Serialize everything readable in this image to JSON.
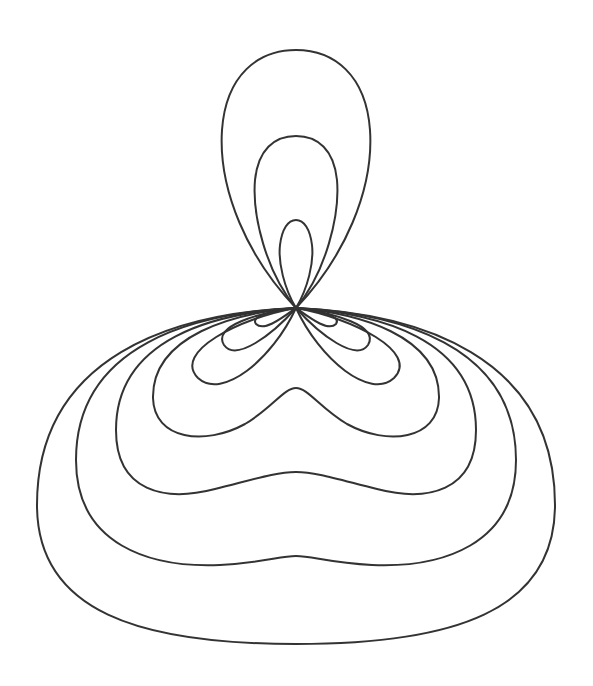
{
  "figure": {
    "background": "#ffffff",
    "stroke_color": "#333333",
    "origin": [
      296,
      308
    ],
    "top_lobes": [
      {
        "name": "top-lobe-outer",
        "top_y": 50,
        "x_range": [
          222,
          370
        ]
      },
      {
        "name": "top-lobe-middle",
        "top_y": 136,
        "x_range": [
          254,
          338
        ]
      },
      {
        "name": "top-lobe-inner",
        "top_y": 220,
        "x_range": [
          280,
          313
        ]
      }
    ],
    "side_lobe_pairs": [
      {
        "name": "side-lobes-1",
        "outer_x": [
          255,
          337
        ],
        "bottom_y": 327
      },
      {
        "name": "side-lobes-2",
        "outer_x": [
          220,
          372
        ],
        "bottom_y": 353
      },
      {
        "name": "side-lobes-3",
        "outer_x": [
          189,
          404
        ],
        "bottom_y": 388
      }
    ],
    "closed_curves": [
      {
        "name": "bulb-1",
        "center_bottom_y": 388,
        "x_range": [
          153,
          440
        ]
      },
      {
        "name": "bulb-2",
        "center_bottom_y": 472,
        "x_range": [
          116,
          478
        ]
      },
      {
        "name": "bulb-3",
        "center_bottom_y": 556,
        "x_range": [
          76,
          516
        ]
      },
      {
        "name": "bulb-4",
        "center_bottom_y": 644,
        "x_range": [
          37,
          556
        ]
      }
    ]
  }
}
